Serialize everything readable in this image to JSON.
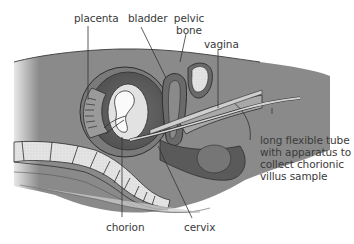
{
  "diagram": {
    "type": "anatomical-cross-section",
    "labels": {
      "placenta": "placenta",
      "bladder": "bladder",
      "pelvic_bone": "pelvic bone",
      "pelvic_bone_line1": "pelvic",
      "pelvic_bone_line2": "bone",
      "vagina": "vagina",
      "tube": "long flexible tube with apparatus to collect chorionic villus sample",
      "tube_line1": "long flexible tube",
      "tube_line2": "with apparatus to",
      "tube_line3": "collect chorionic",
      "tube_line4": "villus sample",
      "chorion": "chorion",
      "cervix": "cervix"
    },
    "colors": {
      "body_fill": "#8c8c8c",
      "body_dark": "#5e5e5e",
      "tissue_light": "#bdbdbd",
      "bone_fill": "#e6e6e6",
      "outline": "#2e2e2e",
      "label_text": "#3a3a3a",
      "leader_line": "#333333"
    }
  }
}
